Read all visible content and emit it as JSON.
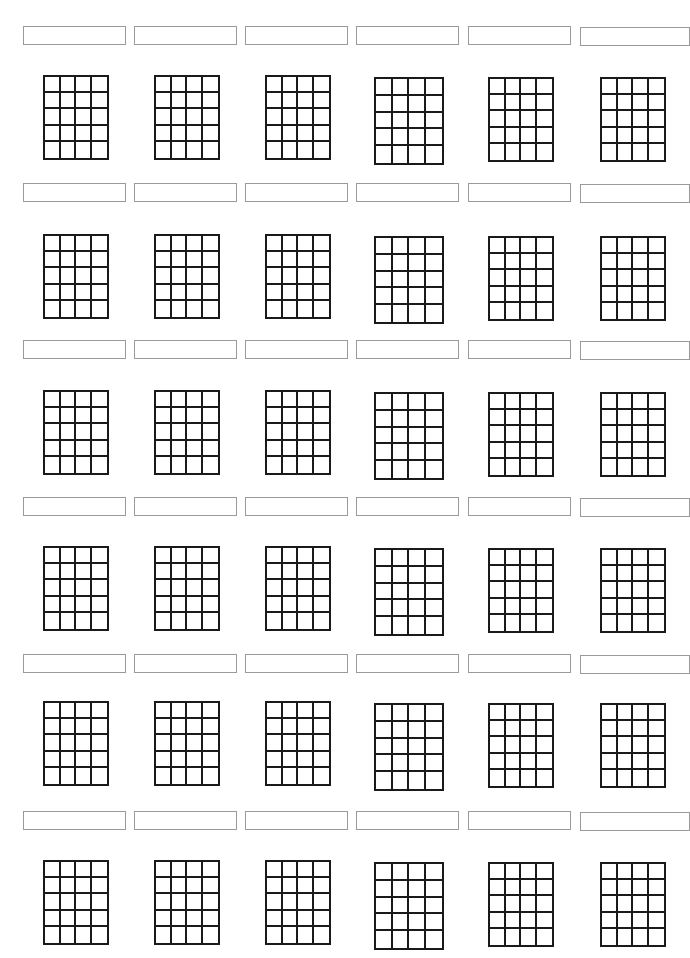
{
  "sheet": {
    "title": "",
    "columns": 6,
    "rows": 6,
    "grid_strings": 5,
    "grid_frets": 5,
    "line_color": "#1a1a1a",
    "label_border_color": "#9a9a9a"
  },
  "layout": {
    "col_label_x": [
      23,
      134,
      245,
      356,
      468,
      580
    ],
    "col_grid_x": [
      43,
      154,
      265,
      374,
      488,
      600
    ],
    "col_grid_w": [
      66,
      66,
      66,
      70,
      66,
      66
    ],
    "row_label_y": [
      26,
      183,
      340,
      497,
      654,
      811
    ],
    "row_grid_y": [
      75,
      234,
      390,
      546,
      701,
      860
    ],
    "grid_h": 85
  },
  "diagrams": [
    {
      "label": ""
    },
    {
      "label": ""
    },
    {
      "label": ""
    },
    {
      "label": ""
    },
    {
      "label": ""
    },
    {
      "label": ""
    },
    {
      "label": ""
    },
    {
      "label": ""
    },
    {
      "label": ""
    },
    {
      "label": ""
    },
    {
      "label": ""
    },
    {
      "label": ""
    },
    {
      "label": ""
    },
    {
      "label": ""
    },
    {
      "label": ""
    },
    {
      "label": ""
    },
    {
      "label": ""
    },
    {
      "label": ""
    },
    {
      "label": ""
    },
    {
      "label": ""
    },
    {
      "label": ""
    },
    {
      "label": ""
    },
    {
      "label": ""
    },
    {
      "label": ""
    },
    {
      "label": ""
    },
    {
      "label": ""
    },
    {
      "label": ""
    },
    {
      "label": ""
    },
    {
      "label": ""
    },
    {
      "label": ""
    },
    {
      "label": ""
    },
    {
      "label": ""
    },
    {
      "label": ""
    },
    {
      "label": ""
    },
    {
      "label": ""
    },
    {
      "label": ""
    }
  ]
}
